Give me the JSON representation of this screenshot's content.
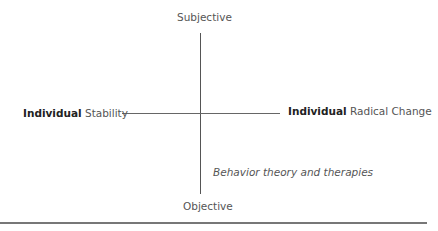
{
  "diagram": {
    "axis_top": "Subjective",
    "axis_bottom": "Objective",
    "axis_left": {
      "bold": "Individual",
      "rest": "Stability"
    },
    "axis_right": {
      "bold": "Individual",
      "rest": "Radical Change"
    },
    "quadrant_items": [
      {
        "text": "Behavior theory and therapies",
        "quadrant": "bottom-right"
      }
    ]
  }
}
